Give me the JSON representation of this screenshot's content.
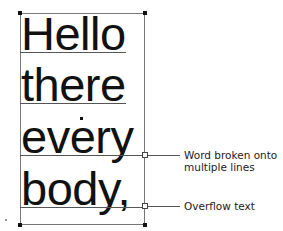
{
  "text_frame": {
    "lines": [
      "Hello",
      "there",
      "every",
      "body,"
    ]
  },
  "callouts": [
    {
      "label": "Word broken onto multiple lines",
      "line1": "Word broken onto",
      "line2": "multiple lines"
    },
    {
      "label": "Overflow text",
      "line1": "Overflow text"
    }
  ],
  "colors": {
    "text": "#111111",
    "frame": "#777777",
    "background": "#ffffff"
  }
}
